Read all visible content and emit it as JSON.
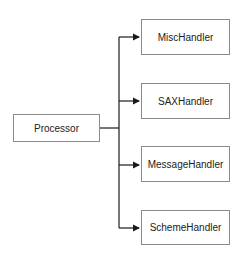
{
  "diagram": {
    "type": "class-composition",
    "source": {
      "label": "Processor"
    },
    "targets": [
      {
        "label": "MiscHandler"
      },
      {
        "label": "SAXHandler"
      },
      {
        "label": "MessageHandler"
      },
      {
        "label": "SchemeHandler"
      }
    ],
    "colors": {
      "line": "#1a1a1a",
      "border": "#8a8a8a",
      "text": "#222222"
    }
  }
}
